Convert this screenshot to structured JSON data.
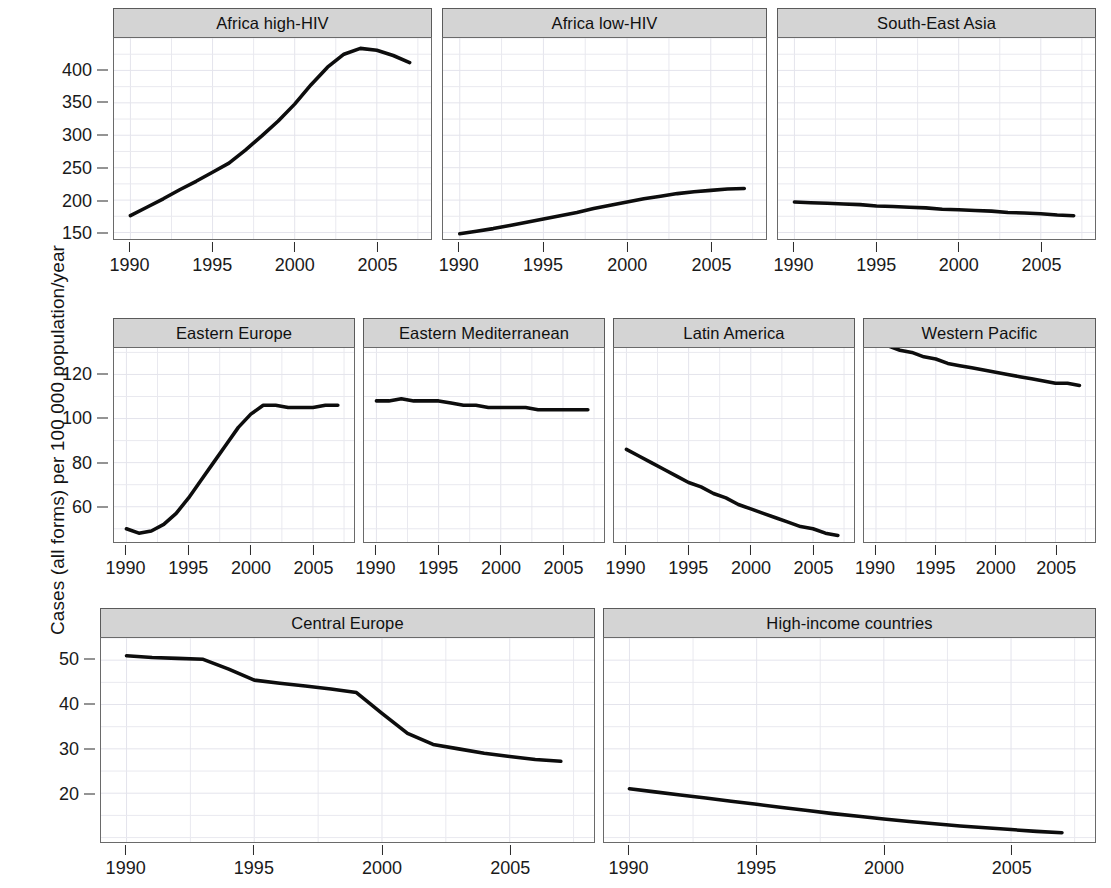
{
  "figure": {
    "ylabel": "Cases (all forms) per 100 000 population/year",
    "line_color": "#0d0d0d",
    "strip_color": "#d4d4d4",
    "grid_color": "#e9e9ef"
  },
  "chart_data": {
    "type": "line",
    "title": "",
    "xlabel": "",
    "ylabel": "Cases (all forms) per 100 000 population/year",
    "grid": true,
    "legend": "none",
    "x": [
      1990,
      1991,
      1992,
      1993,
      1994,
      1995,
      1996,
      1997,
      1998,
      1999,
      2000,
      2001,
      2002,
      2003,
      2004,
      2005,
      2006,
      2007
    ],
    "rows": [
      {
        "row_index": 0,
        "yticks": [
          150,
          200,
          250,
          300,
          350,
          400
        ],
        "ylim": [
          140,
          450
        ],
        "xticks": [
          1990,
          1995,
          2000,
          2005
        ],
        "xlim": [
          1989.2,
          1997.8
        ],
        "panels": [
          {
            "title": "Africa high-HIV",
            "values": [
              176,
              189,
              202,
              216,
              229,
              243,
              257,
              277,
              299,
              322,
              348,
              378,
              405,
              425,
              434,
              431,
              423,
              412
            ]
          },
          {
            "title": "Africa low-HIV",
            "values": [
              148,
              152,
              156,
              161,
              166,
              171,
              176,
              181,
              187,
              192,
              197,
              202,
              206,
              210,
              213,
              215,
              217,
              218
            ]
          },
          {
            "title": "South-East Asia",
            "values": [
              197,
              196,
              195,
              194,
              193,
              191,
              190,
              189,
              188,
              186,
              185,
              184,
              183,
              181,
              180,
              179,
              177,
              176
            ]
          }
        ]
      },
      {
        "row_index": 1,
        "yticks": [
          60,
          80,
          100,
          120
        ],
        "ylim": [
          44,
          132
        ],
        "xticks": [
          1990,
          1995,
          2000,
          2005
        ],
        "panels": [
          {
            "title": "Eastern Europe",
            "values": [
              50,
              48,
              49,
              52,
              57,
              64,
              72,
              80,
              88,
              96,
              102,
              106,
              106,
              105,
              105,
              105,
              106,
              106
            ]
          },
          {
            "title": "Eastern Mediterranean",
            "values": [
              108,
              108,
              109,
              108,
              108,
              108,
              107,
              106,
              106,
              105,
              105,
              105,
              105,
              104,
              104,
              104,
              104,
              104
            ]
          },
          {
            "title": "Latin America",
            "values": [
              86,
              83,
              80,
              77,
              74,
              71,
              69,
              66,
              64,
              61,
              59,
              57,
              55,
              53,
              51,
              50,
              48,
              47
            ]
          },
          {
            "title": "Western Pacific",
            "values": [
              135,
              133,
              131,
              130,
              128,
              127,
              125,
              124,
              123,
              122,
              121,
              120,
              119,
              118,
              117,
              116,
              116,
              115
            ]
          }
        ]
      },
      {
        "row_index": 2,
        "yticks": [
          20,
          30,
          40,
          50
        ],
        "ylim": [
          9,
          55
        ],
        "xticks": [
          1990,
          1995,
          2000,
          2005
        ],
        "panels": [
          {
            "title": "Central Europe",
            "values": [
              51,
              50.6,
              50.4,
              50.2,
              48,
              45.5,
              44.8,
              44.2,
              43.5,
              42.7,
              38,
              33.5,
              31,
              30,
              29,
              28.3,
              27.6,
              27.2
            ]
          },
          {
            "title": "High-income countries",
            "values": [
              21,
              20.3,
              19.6,
              18.9,
              18.2,
              17.5,
              16.8,
              16.1,
              15.4,
              14.8,
              14.2,
              13.6,
              13.1,
              12.6,
              12.2,
              11.8,
              11.4,
              11.1
            ]
          }
        ]
      }
    ]
  }
}
